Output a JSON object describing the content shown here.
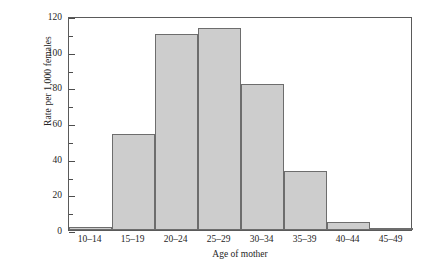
{
  "chart_data": {
    "type": "bar",
    "title": "",
    "subtitle": "",
    "xlabel": "Age of mother",
    "ylabel": "Rate per 1,000 females",
    "categories": [
      "10–14",
      "15–19",
      "20–24",
      "25–29",
      "30–34",
      "35–39",
      "40–44",
      "45–49"
    ],
    "values": [
      1.5,
      54,
      110,
      113,
      82,
      33,
      4.5,
      0.5
    ],
    "ylim": [
      0,
      120
    ],
    "ytick_labels": [
      "0",
      "20",
      "40",
      "60",
      "80",
      "100",
      "120"
    ],
    "ytick_values": [
      0,
      20,
      40,
      60,
      80,
      100,
      120
    ],
    "yminor_values": [
      10,
      30,
      50,
      70,
      90,
      110
    ],
    "grid": false,
    "legend": "none",
    "bar_fill": "#cdcdcd",
    "bar_edge": "#6d6d6d",
    "frame_color": "#5a5a5a",
    "text_color": "#262626"
  }
}
